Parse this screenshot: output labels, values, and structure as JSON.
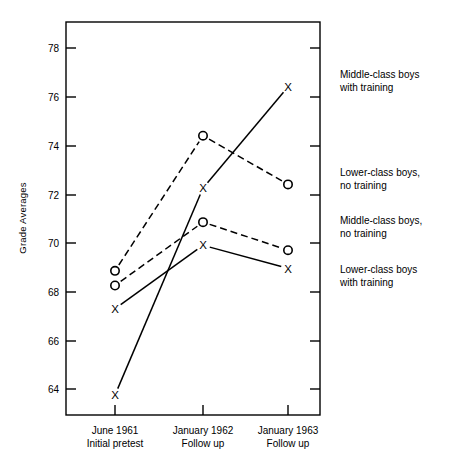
{
  "chart_data": {
    "type": "line",
    "title": "",
    "xlabel": "",
    "ylabel": "Grade Averages",
    "categories": [
      "June 1961\nInitial pretest",
      "January 1962\nFollow up",
      "January 1963\nFollow up"
    ],
    "category_lines": [
      [
        "June 1961",
        "Initial pretest"
      ],
      [
        "January 1962",
        "Follow up"
      ],
      [
        "January 1963",
        "Follow up"
      ]
    ],
    "x": [
      1,
      2,
      3
    ],
    "ylim": [
      63.0,
      78.9
    ],
    "yticks": [
      64,
      66,
      68,
      70,
      72,
      74,
      76,
      78
    ],
    "ytick_labels": [
      "64",
      "66",
      "68",
      "70",
      "72",
      "74",
      "76",
      "78"
    ],
    "grid": false,
    "legend_position": "right-outside",
    "series": [
      {
        "name": "Middle-class boys with training",
        "marker": "X",
        "linestyle": "solid",
        "color": "#000000",
        "values": [
          63.75,
          72.25,
          76.4
        ]
      },
      {
        "name": "Lower-class boys, no training",
        "marker": "O",
        "linestyle": "dashed",
        "color": "#000000",
        "values": [
          68.85,
          74.4,
          72.4
        ]
      },
      {
        "name": "Middle-class boys, no training",
        "marker": "O",
        "linestyle": "dashed",
        "color": "#000000",
        "values": [
          68.25,
          70.85,
          69.7
        ]
      },
      {
        "name": "Lower-class boys with training",
        "marker": "X",
        "linestyle": "solid",
        "color": "#000000",
        "values": [
          67.3,
          69.9,
          68.95
        ]
      }
    ],
    "annotations": [
      {
        "text_lines": [
          "Middle-class boys",
          "with training"
        ],
        "anchor_value": 76.4
      },
      {
        "text_lines": [
          "Lower-class boys,",
          "no training"
        ],
        "anchor_value": 72.4
      },
      {
        "text_lines": [
          "Middle-class boys,",
          "no training"
        ],
        "anchor_value": 69.7
      },
      {
        "text_lines": [
          "Lower-class boys",
          "with training"
        ],
        "anchor_value": 68.0
      }
    ]
  },
  "axis": {
    "y_title": "Grade Averages"
  },
  "ticks": {
    "y": [
      "78",
      "76",
      "74",
      "72",
      "70",
      "68",
      "66",
      "64"
    ]
  },
  "xlabels": {
    "c0_l1": "June 1961",
    "c0_l2": "Initial pretest",
    "c1_l1": "January 1962",
    "c1_l2": "Follow up",
    "c2_l1": "January 1963",
    "c2_l2": "Follow up"
  },
  "legend": {
    "l0_l1": "Middle-class boys",
    "l0_l2": "with training",
    "l1_l1": "Lower-class boys,",
    "l1_l2": "no training",
    "l2_l1": "Middle-class boys,",
    "l2_l2": "no training",
    "l3_l1": "Lower-class boys",
    "l3_l2": "with training"
  },
  "colors": {
    "ink": "#000000",
    "paper": "#ffffff"
  }
}
